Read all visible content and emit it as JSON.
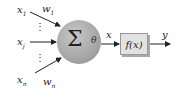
{
  "inputs": [
    {
      "base": "x",
      "sub": "1"
    },
    {
      "base": "x",
      "sub": "j"
    },
    {
      "base": "x",
      "sub": "n"
    }
  ],
  "weights": [
    {
      "base": "w",
      "sub": "1"
    },
    {
      "base": "w",
      "sub": "n"
    }
  ],
  "neuron": {
    "sum_symbol": "Σ",
    "threshold": "θ"
  },
  "intermediate": "x",
  "activation": "f(x)",
  "output": "y",
  "ellipsis": "⋮"
}
